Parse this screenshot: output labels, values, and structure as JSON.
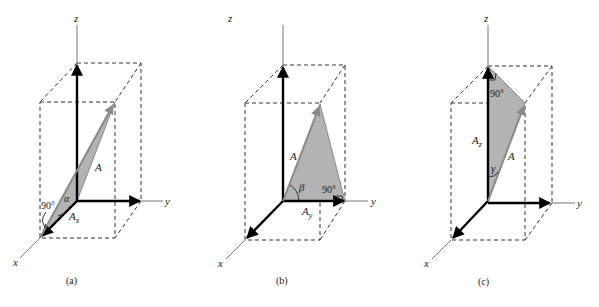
{
  "figure": {
    "panels": [
      {
        "id": "a",
        "caption": "(a)",
        "axes": {
          "x": "x",
          "y": "y",
          "z": "z"
        },
        "vector_label": "A",
        "component_label": "A",
        "component_subscript": "x",
        "angle_label": "α",
        "right_angle_label": "90°"
      },
      {
        "id": "b",
        "caption": "(b)",
        "axes": {
          "x": "x",
          "y": "y",
          "z": "z"
        },
        "vector_label": "A",
        "component_label": "A",
        "component_subscript": "y",
        "angle_label": "β",
        "right_angle_label": "90°"
      },
      {
        "id": "c",
        "caption": "(c)",
        "axes": {
          "x": "x",
          "y": "y",
          "z": "z"
        },
        "vector_label": "A",
        "component_label": "A",
        "component_subscript": "z",
        "angle_label": "γ",
        "right_angle_label": "90°"
      }
    ],
    "colors": {
      "shaded_triangle": "#b3b3b3",
      "vector_A": "#8a8a8a",
      "axis_arrows": "#000000",
      "dashed_box": "#333333"
    }
  }
}
